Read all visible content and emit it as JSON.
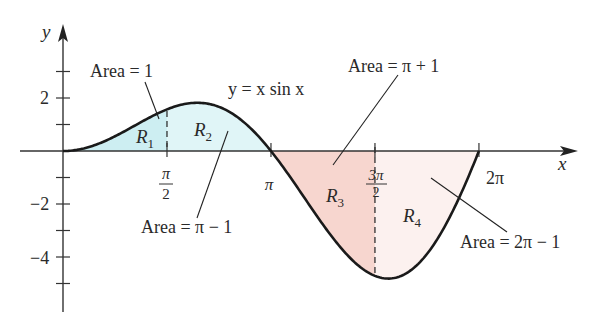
{
  "figure": {
    "function_label": "y = x sin x",
    "x_axis_label": "x",
    "y_axis_label": "y"
  },
  "axes": {
    "x_ticks": [
      {
        "value": 1.5707963,
        "num": "π",
        "den": "2"
      },
      {
        "value": 3.1415927,
        "label": "π"
      },
      {
        "value": 4.712389,
        "num": "3π",
        "den": "2"
      },
      {
        "value": 6.2831853,
        "label": "2π"
      }
    ],
    "y_ticks": [
      3,
      2,
      1,
      -1,
      -2,
      -3,
      -4,
      -5
    ],
    "y_tick_labels": [
      {
        "value": 2,
        "label": "2"
      },
      {
        "value": -2,
        "label": "−2"
      },
      {
        "value": -4,
        "label": "−4"
      }
    ]
  },
  "regions": [
    {
      "id": "R1",
      "name": "R",
      "sub": "1",
      "x_from": 0,
      "x_to": 1.5707963,
      "fill": "#cdeef2",
      "area_label": "Area = 1"
    },
    {
      "id": "R2",
      "name": "R",
      "sub": "2",
      "x_from": 1.5707963,
      "x_to": 3.1415927,
      "fill": "#e0f5f7",
      "area_label": "Area = π − 1"
    },
    {
      "id": "R3",
      "name": "R",
      "sub": "3",
      "x_from": 3.1415927,
      "x_to": 4.712389,
      "fill": "#f7d6cf",
      "area_label": "Area = π + 1"
    },
    {
      "id": "R4",
      "name": "R",
      "sub": "4",
      "x_from": 4.712389,
      "x_to": 6.2831853,
      "fill": "#fcf1ef",
      "area_label": "Area = 2π − 1"
    }
  ],
  "colors": {
    "curve": "#1a1a1a",
    "axis": "#333333",
    "text": "#2a2a2a"
  }
}
